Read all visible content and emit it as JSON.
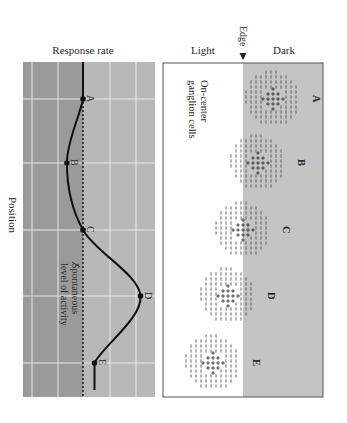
{
  "graph": {
    "title": "Response rate",
    "axis_label": "Position",
    "baseline_label_line1": "Spontaneous",
    "baseline_label_line2": "level of activity",
    "colors": {
      "below_baseline": "#9a9a9a",
      "above_baseline": "#b8b8b8",
      "grid": "#e8e8e8",
      "curve": "#111111"
    },
    "points": [
      {
        "label": "A",
        "response": 0.0
      },
      {
        "label": "B",
        "response": -0.35
      },
      {
        "label": "C",
        "response": 0.0
      },
      {
        "label": "D",
        "response": 1.25
      },
      {
        "label": "E",
        "response": 0.25
      }
    ],
    "tail_start_response": 0.0,
    "tail_end_response": 0.25
  },
  "stimulus": {
    "light_label": "Light",
    "dark_label": "Dark",
    "edge_label": "Edge",
    "cells_label_line1": "On-center",
    "cells_label_line2": "ganglion cells",
    "colors": {
      "light": "#ffffff",
      "dark": "#c4c4c4",
      "frame": "#555555"
    },
    "cells": [
      {
        "label": "A",
        "offset_from_edge": 1.0
      },
      {
        "label": "B",
        "offset_from_edge": 0.5
      },
      {
        "label": "C",
        "offset_from_edge": 0.0
      },
      {
        "label": "D",
        "offset_from_edge": -0.5
      },
      {
        "label": "E",
        "offset_from_edge": -1.0
      }
    ]
  }
}
